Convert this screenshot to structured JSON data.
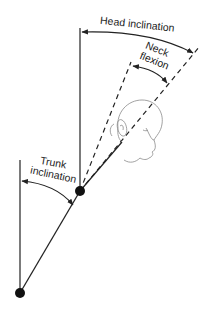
{
  "diagram": {
    "labels": {
      "head_inclination": "Head inclination",
      "neck_line1": "Neck",
      "neck_line2": "flexion",
      "trunk_line1": "Trunk",
      "trunk_line2": "inclination"
    },
    "colors": {
      "line": "#222222",
      "head_outline": "#8a8a8a",
      "joint": "#111111"
    }
  }
}
